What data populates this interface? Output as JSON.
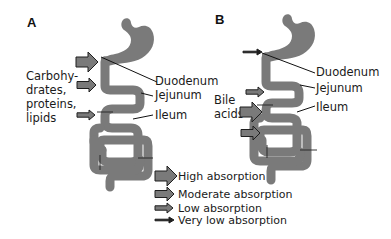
{
  "figure": {
    "colors": {
      "organ_fill": "#7a7a7a",
      "arrow_fill": "#7a7a7a",
      "outline": "#1f1f1f",
      "text": "#1a1a1a",
      "background": "#ffffff"
    },
    "panels": [
      {
        "id": "A",
        "label": "A",
        "side_label_lines": [
          "Carbohy-",
          "drates,",
          "proteins,",
          "lipids"
        ],
        "segment_labels": {
          "duodenum": "Duodenum",
          "jejunum": "Jejunum",
          "ileum": "Ileum"
        },
        "arrows": [
          {
            "segment": "duodenum",
            "level": "high"
          },
          {
            "segment": "jejunum",
            "level": "moderate"
          },
          {
            "segment": "ileum",
            "level": "low"
          }
        ]
      },
      {
        "id": "B",
        "label": "B",
        "side_label_lines": [
          "Bile",
          "acids"
        ],
        "segment_labels": {
          "duodenum": "Duodenum",
          "jejunum": "Jejunum",
          "ileum": "Ileum"
        },
        "arrows": [
          {
            "segment": "duodenum",
            "level": "very_low"
          },
          {
            "segment": "jejunum",
            "level": "low"
          },
          {
            "segment": "ileum_proximal",
            "level": "high"
          },
          {
            "segment": "ileum_distal",
            "level": "moderate"
          }
        ]
      }
    ],
    "legend": {
      "items": [
        {
          "level": "high",
          "label": "High absorption"
        },
        {
          "level": "moderate",
          "label": "Moderate absorption"
        },
        {
          "level": "low",
          "label": "Low absorption"
        },
        {
          "level": "very_low",
          "label": "Very low absorption"
        }
      ]
    }
  }
}
